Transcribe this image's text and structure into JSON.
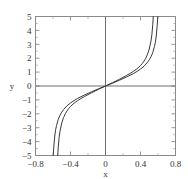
{
  "chart_data": {
    "type": "line",
    "title": "",
    "xlabel": "x",
    "ylabel": "y",
    "xlim": [
      -0.8,
      0.8
    ],
    "ylim": [
      -5,
      5
    ],
    "grid": false,
    "legend": null,
    "xticks": [
      -0.8,
      -0.4,
      0,
      0.4,
      0.8
    ],
    "xticklabels": [
      "-0.8",
      "-0.4",
      "0",
      "0.4",
      "0.8"
    ],
    "yticks": [
      -5,
      -4,
      -3,
      -2,
      -1,
      0,
      1,
      2,
      3,
      4,
      5
    ],
    "yticklabels": [
      "-5",
      "-4",
      "-3",
      "-2",
      "-1",
      "0",
      "1",
      "2",
      "3",
      "4",
      "5"
    ],
    "minor_xticks": [
      -0.6,
      -0.2,
      0.2,
      0.6
    ],
    "minor_yticks": [
      -4.5,
      -3.5,
      -2.5,
      -1.5,
      -0.5,
      0.5,
      1.5,
      2.5,
      3.5,
      4.5
    ],
    "series": [
      {
        "name": "curve-1",
        "color": "#3a3a3a",
        "asymptote": 0.55,
        "x": [
          -0.546,
          -0.54,
          -0.53,
          -0.52,
          -0.5,
          -0.48,
          -0.46,
          -0.44,
          -0.42,
          -0.4,
          -0.36,
          -0.32,
          -0.28,
          -0.24,
          -0.2,
          -0.16,
          -0.12,
          -0.08,
          -0.04,
          0.0,
          0.04,
          0.08,
          0.12,
          0.16,
          0.2,
          0.24,
          0.28,
          0.32,
          0.36,
          0.4,
          0.42,
          0.44,
          0.46,
          0.48,
          0.5,
          0.52,
          0.53,
          0.54,
          0.546
        ],
        "y": [
          -5.0,
          -4.4,
          -3.7,
          -3.25,
          -2.66,
          -2.28,
          -2.0,
          -1.79,
          -1.62,
          -1.47,
          -1.24,
          -1.06,
          -0.9,
          -0.76,
          -0.62,
          -0.49,
          -0.36,
          -0.24,
          -0.12,
          0.0,
          0.12,
          0.24,
          0.36,
          0.49,
          0.62,
          0.76,
          0.9,
          1.06,
          1.24,
          1.47,
          1.62,
          1.79,
          2.0,
          2.28,
          2.66,
          3.25,
          3.7,
          4.4,
          5.0
        ]
      },
      {
        "name": "curve-2",
        "color": "#3a3a3a",
        "asymptote": 0.6,
        "x": [
          -0.598,
          -0.59,
          -0.58,
          -0.57,
          -0.56,
          -0.54,
          -0.52,
          -0.5,
          -0.48,
          -0.44,
          -0.4,
          -0.36,
          -0.32,
          -0.28,
          -0.24,
          -0.2,
          -0.16,
          -0.12,
          -0.08,
          -0.04,
          0.0,
          0.04,
          0.08,
          0.12,
          0.16,
          0.2,
          0.24,
          0.28,
          0.32,
          0.36,
          0.4,
          0.44,
          0.48,
          0.5,
          0.52,
          0.54,
          0.56,
          0.57,
          0.58,
          0.59,
          0.598
        ],
        "y": [
          -5.0,
          -4.3,
          -3.6,
          -3.15,
          -2.85,
          -2.4,
          -2.1,
          -1.88,
          -1.7,
          -1.42,
          -1.22,
          -1.05,
          -0.9,
          -0.77,
          -0.65,
          -0.53,
          -0.42,
          -0.31,
          -0.2,
          -0.1,
          0.0,
          0.1,
          0.2,
          0.31,
          0.42,
          0.53,
          0.65,
          0.77,
          0.9,
          1.05,
          1.22,
          1.42,
          1.7,
          1.88,
          2.1,
          2.4,
          2.85,
          3.15,
          3.6,
          4.3,
          5.0
        ]
      }
    ],
    "colors": {
      "frame": "#8a8a8a",
      "axis_line": "#6e6e6e",
      "curve": "#3a3a3a",
      "background": "#ffffff",
      "text": "#333333"
    }
  }
}
